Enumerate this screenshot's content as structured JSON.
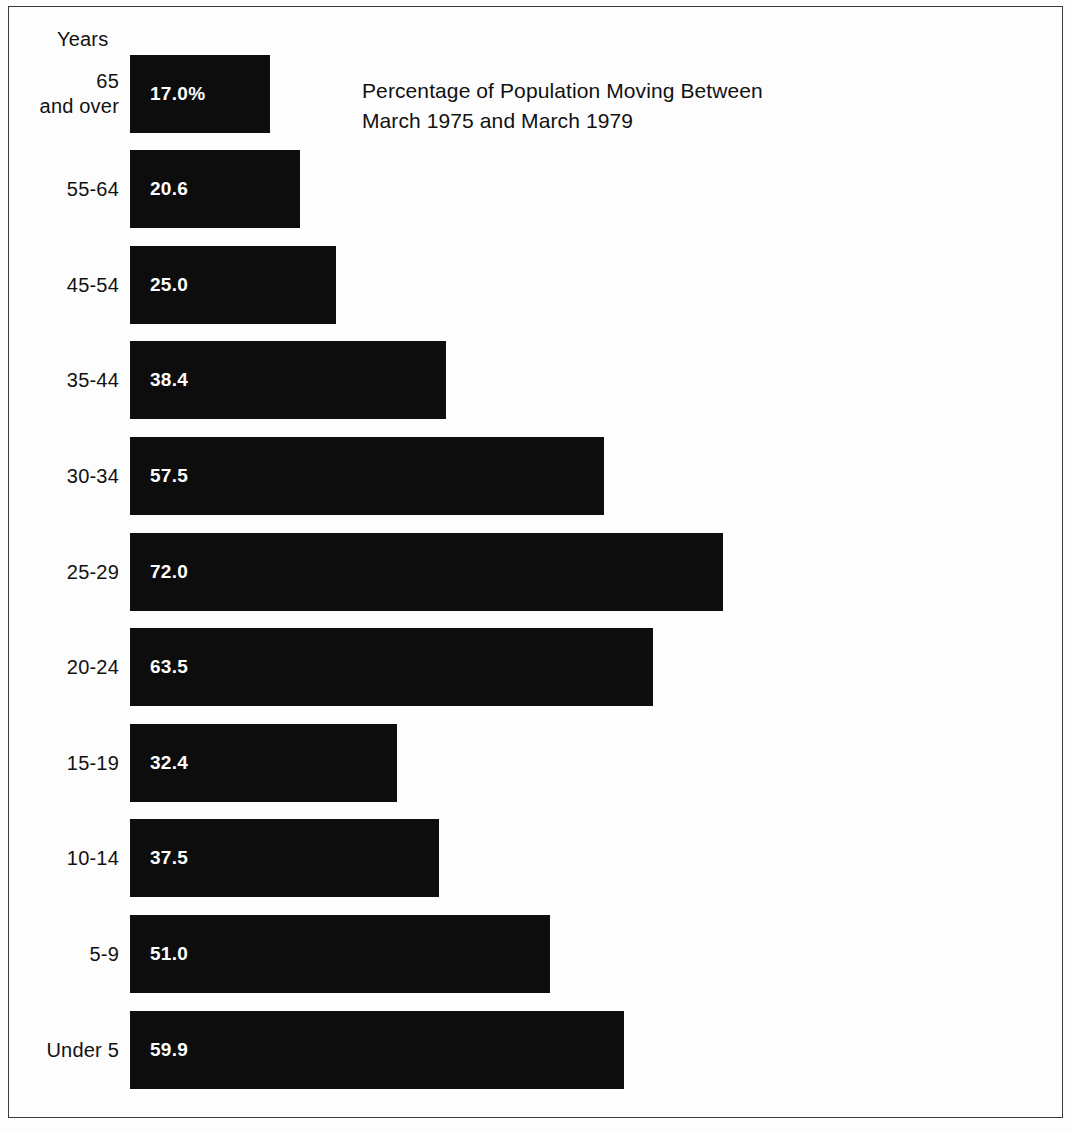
{
  "figure": {
    "axis_title": "Years",
    "title": "Percentage of Population Moving Between\nMarch 1975 and March 1979",
    "bar_color": "#0d0d0d",
    "value_text_color": "#ffffff",
    "background_color": "#fdfdfd",
    "frame_color": "#3a3a3a"
  },
  "chart_data": {
    "type": "bar",
    "orientation": "horizontal",
    "title": "Percentage of Population Moving Between March 1975 and March 1979",
    "xlabel": "",
    "ylabel": "Years",
    "grid": false,
    "legend": null,
    "xlim": [
      0,
      75
    ],
    "categories": [
      "65\nand over",
      "55-64",
      "45-54",
      "35-44",
      "30-34",
      "25-29",
      "20-24",
      "15-19",
      "10-14",
      "5-9",
      "Under 5"
    ],
    "values": [
      17.0,
      20.6,
      25.0,
      38.4,
      57.5,
      72.0,
      63.5,
      32.4,
      37.5,
      51.0,
      59.9
    ],
    "value_labels": [
      "17.0%",
      "20.6",
      "25.0",
      "38.4",
      "57.5",
      "72.0",
      "63.5",
      "32.4",
      "37.5",
      "51.0",
      "59.9"
    ],
    "bars": [
      {
        "category": "65\nand over",
        "value": 17.0,
        "label": "17.0%",
        "top": 55
      },
      {
        "category": "55-64",
        "value": 20.6,
        "label": "20.6",
        "top": 150
      },
      {
        "category": "45-54",
        "value": 25.0,
        "label": "25.0",
        "top": 246
      },
      {
        "category": "35-44",
        "value": 38.4,
        "label": "38.4",
        "top": 341
      },
      {
        "category": "30-34",
        "value": 57.5,
        "label": "57.5",
        "top": 437
      },
      {
        "category": "25-29",
        "value": 72.0,
        "label": "72.0",
        "top": 533
      },
      {
        "category": "20-24",
        "value": 63.5,
        "label": "63.5",
        "top": 628
      },
      {
        "category": "15-19",
        "value": 32.4,
        "label": "32.4",
        "top": 724
      },
      {
        "category": "10-14",
        "value": 37.5,
        "label": "37.5",
        "top": 819
      },
      {
        "category": "5-9",
        "value": 51.0,
        "label": "51.0",
        "top": 915
      },
      {
        "category": "Under 5",
        "value": 59.9,
        "label": "59.9",
        "top": 1011
      }
    ]
  }
}
